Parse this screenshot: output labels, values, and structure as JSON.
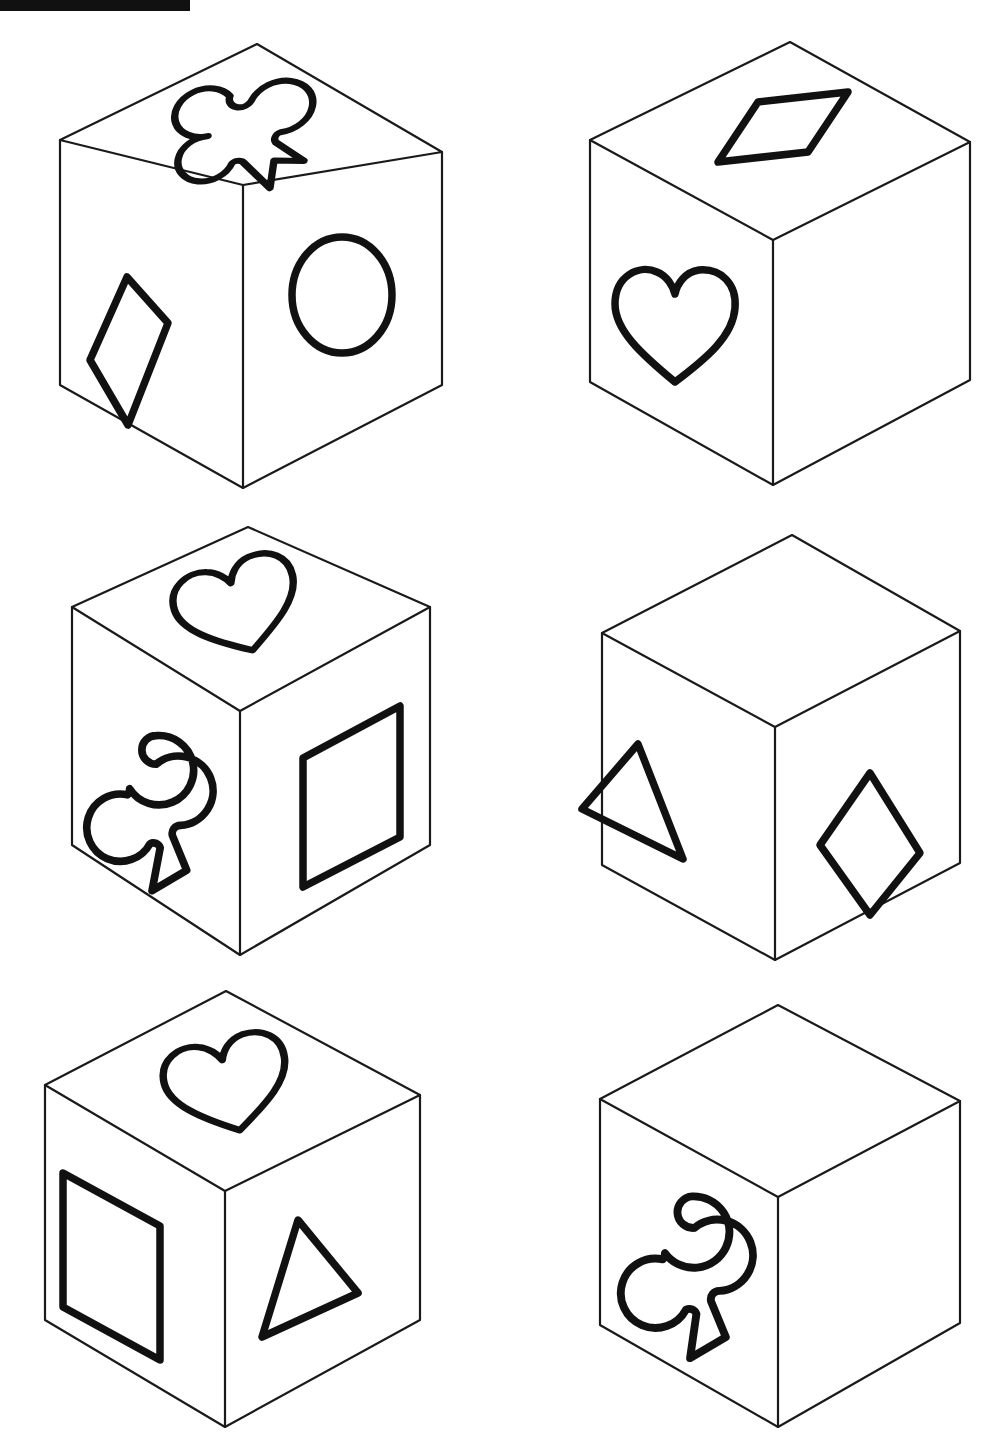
{
  "page": {
    "background_color": "#ffffff",
    "ink_color": "#111111",
    "width": 1008,
    "height": 1445,
    "artifact_label": "scan-edge-black-bar"
  },
  "legend": {
    "shape_names": [
      "club",
      "diamond",
      "ellipse",
      "heart",
      "square",
      "triangle"
    ]
  },
  "cubes": [
    {
      "id": "cube-1",
      "position": "top-left",
      "row": 1,
      "column": 1,
      "faces": {
        "top": "club",
        "left": "diamond",
        "right": "ellipse"
      }
    },
    {
      "id": "cube-2",
      "position": "top-right",
      "row": 1,
      "column": 2,
      "faces": {
        "top": "diamond",
        "left": "heart",
        "right": "blank"
      }
    },
    {
      "id": "cube-3",
      "position": "middle-left",
      "row": 2,
      "column": 1,
      "faces": {
        "top": "heart",
        "left": "club",
        "right": "square"
      }
    },
    {
      "id": "cube-4",
      "position": "middle-right",
      "row": 2,
      "column": 2,
      "faces": {
        "top": "blank",
        "left": "triangle",
        "right": "diamond"
      }
    },
    {
      "id": "cube-5",
      "position": "bottom-left",
      "row": 3,
      "column": 1,
      "faces": {
        "top": "heart",
        "left": "square",
        "right": "triangle"
      }
    },
    {
      "id": "cube-6",
      "position": "bottom-right",
      "row": 3,
      "column": 2,
      "faces": {
        "top": "blank",
        "left": "club",
        "right": "blank"
      }
    }
  ]
}
